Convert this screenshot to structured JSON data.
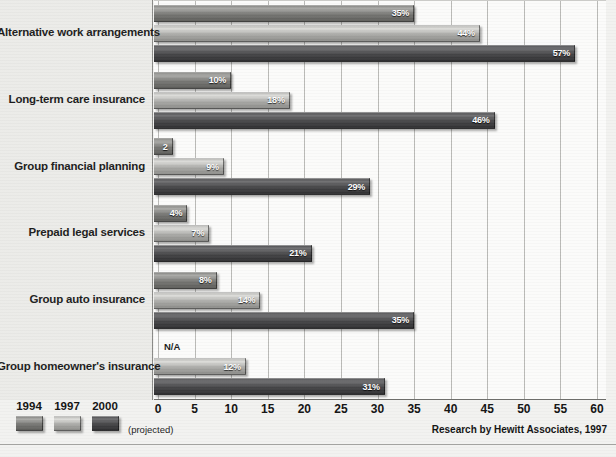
{
  "chart_data": {
    "type": "bar",
    "orientation": "horizontal",
    "title": "",
    "xlabel": "",
    "ylabel": "",
    "xlim": [
      0,
      60
    ],
    "xticks": [
      0,
      5,
      10,
      15,
      20,
      25,
      30,
      35,
      40,
      45,
      50,
      55,
      60
    ],
    "grid": true,
    "legend_position": "bottom-left",
    "categories": [
      "Alternative work arrangements",
      "Long-term care insurance",
      "Group financial planning",
      "Prepaid legal services",
      "Group auto insurance",
      "Group homeowner's insurance"
    ],
    "series": [
      {
        "name": "1994",
        "color": "#8f8f8c",
        "values": [
          35,
          10,
          2,
          4,
          8,
          null
        ],
        "labels": [
          "35%",
          "10%",
          "2",
          "4%",
          "8%",
          "N/A"
        ]
      },
      {
        "name": "1997",
        "color": "#c2c2bf",
        "values": [
          44,
          18,
          9,
          7,
          14,
          12
        ],
        "labels": [
          "44%",
          "18%",
          "9%",
          "7%",
          "14%",
          "12%"
        ]
      },
      {
        "name": "2000",
        "color": "#58585a",
        "values": [
          57,
          46,
          29,
          21,
          35,
          31
        ],
        "labels": [
          "57%",
          "46%",
          "29%",
          "21%",
          "35%",
          "31%"
        ]
      }
    ],
    "source": "Research by Hewitt Associates, 1997",
    "legend_note": "(projected)"
  },
  "legend": {
    "entries": [
      {
        "year": "1994"
      },
      {
        "year": "1997"
      },
      {
        "year": "2000"
      }
    ],
    "note": "(projected)"
  },
  "source": {
    "text": "Research by Hewitt Associates, 1997"
  }
}
